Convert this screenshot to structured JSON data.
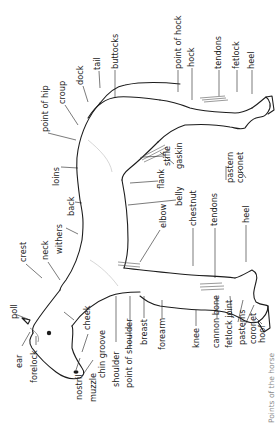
{
  "caption": "Points of the horse",
  "labels": {
    "point_of_hip": "point of hip",
    "croup": "croup",
    "dock": "dock",
    "tail": "tail",
    "buttocks": "buttocks",
    "point_of_hock": "point of hock",
    "hock": "hock",
    "tendons_hind": "tendons",
    "fetlock_hind": "fetlock",
    "heel_hind": "heel",
    "loins": "loins",
    "back": "back",
    "withers": "withers",
    "crest": "crest",
    "neck": "neck",
    "stifle": "stifle",
    "gaskin": "gaskin",
    "flank": "flank",
    "belly": "belly",
    "pastern": "pastern",
    "coronet_hind": "coronet",
    "elbow": "elbow",
    "chestnut": "chestnut",
    "tendons_fore": "tendons",
    "heel_fore": "heel",
    "poll": "poll",
    "ear": "ear",
    "forelock": "forelock",
    "cheek": "cheek",
    "chin_groove": "chin groove",
    "nostril": "nostril",
    "muzzle": "muzzle",
    "shoulder": "shoulder",
    "point_of_shoulder": "point of shoulder",
    "breast": "breast",
    "forearm": "forearm",
    "knee": "knee",
    "cannon_bone": "cannon bone",
    "fetlock_joint": "fetlock joint",
    "pasterns": "pasterns",
    "coronet_fore": "coronet",
    "hoof": "hoof"
  }
}
